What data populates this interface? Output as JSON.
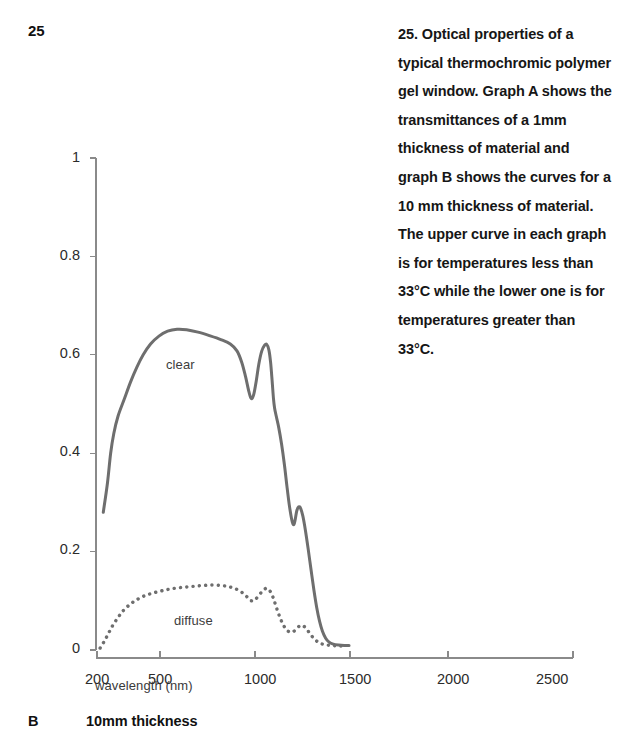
{
  "page_number": "25",
  "caption": "25. Optical properties of a typical thermochromic polymer gel window. Graph A shows the transmittances of a 1mm thickness of material and graph B shows the curves for a 10 mm thickness of material. The upper curve in each graph is for temperatures less than 33°C while the lower one is for temperatures greater than 33°C.",
  "footer": {
    "letter": "B",
    "text": "10mm thickness"
  },
  "colors": {
    "curve": "#6e6e6e",
    "axis": "#8a8a8a",
    "text": "#1a1a1a"
  },
  "chart_data": {
    "type": "line",
    "title": "",
    "xlabel": "wavelength (nm)",
    "ylabel": "hemispherical transmittance",
    "xtick_labels": [
      "200",
      "500",
      "1000",
      "1500",
      "2000",
      "2500"
    ],
    "xtick_values": [
      200,
      500,
      1000,
      1500,
      2000,
      2500
    ],
    "ytick_labels": [
      "0",
      "0.2",
      "0.4",
      "0.6",
      "0.8",
      "1"
    ],
    "ytick_values": [
      0,
      0.2,
      0.4,
      0.6,
      0.8,
      1
    ],
    "xlim": [
      200,
      2500
    ],
    "ylim": [
      0,
      1
    ],
    "grid": false,
    "legend": "inline-annotations",
    "series": [
      {
        "name": "clear",
        "style": "solid",
        "label_position": {
          "x": 620,
          "y": 0.565
        },
        "points": [
          [
            230,
            0.28
          ],
          [
            250,
            0.34
          ],
          [
            265,
            0.4
          ],
          [
            280,
            0.44
          ],
          [
            300,
            0.475
          ],
          [
            330,
            0.51
          ],
          [
            360,
            0.545
          ],
          [
            390,
            0.575
          ],
          [
            420,
            0.6
          ],
          [
            455,
            0.622
          ],
          [
            495,
            0.638
          ],
          [
            540,
            0.648
          ],
          [
            590,
            0.652
          ],
          [
            640,
            0.651
          ],
          [
            700,
            0.646
          ],
          [
            760,
            0.639
          ],
          [
            820,
            0.631
          ],
          [
            870,
            0.622
          ],
          [
            905,
            0.608
          ],
          [
            930,
            0.585
          ],
          [
            950,
            0.556
          ],
          [
            968,
            0.525
          ],
          [
            980,
            0.511
          ],
          [
            993,
            0.519
          ],
          [
            1007,
            0.548
          ],
          [
            1020,
            0.581
          ],
          [
            1035,
            0.607
          ],
          [
            1050,
            0.619
          ],
          [
            1062,
            0.621
          ],
          [
            1073,
            0.61
          ],
          [
            1082,
            0.585
          ],
          [
            1090,
            0.548
          ],
          [
            1097,
            0.512
          ],
          [
            1103,
            0.492
          ],
          [
            1112,
            0.475
          ],
          [
            1125,
            0.452
          ],
          [
            1140,
            0.418
          ],
          [
            1155,
            0.376
          ],
          [
            1168,
            0.333
          ],
          [
            1180,
            0.296
          ],
          [
            1190,
            0.272
          ],
          [
            1198,
            0.258
          ],
          [
            1205,
            0.255
          ],
          [
            1212,
            0.266
          ],
          [
            1220,
            0.283
          ],
          [
            1230,
            0.291
          ],
          [
            1240,
            0.288
          ],
          [
            1252,
            0.272
          ],
          [
            1265,
            0.244
          ],
          [
            1280,
            0.205
          ],
          [
            1295,
            0.163
          ],
          [
            1310,
            0.122
          ],
          [
            1325,
            0.086
          ],
          [
            1340,
            0.058
          ],
          [
            1355,
            0.038
          ],
          [
            1372,
            0.024
          ],
          [
            1390,
            0.016
          ],
          [
            1412,
            0.012
          ],
          [
            1440,
            0.01
          ],
          [
            1470,
            0.009
          ],
          [
            1495,
            0.009
          ]
        ]
      },
      {
        "name": "diffuse",
        "style": "dotted",
        "label_position": {
          "x": 600,
          "y": 0.092
        },
        "points": [
          [
            215,
            0.004
          ],
          [
            235,
            0.018
          ],
          [
            255,
            0.034
          ],
          [
            275,
            0.05
          ],
          [
            300,
            0.066
          ],
          [
            325,
            0.08
          ],
          [
            355,
            0.092
          ],
          [
            385,
            0.101
          ],
          [
            420,
            0.109
          ],
          [
            460,
            0.115
          ],
          [
            505,
            0.12
          ],
          [
            555,
            0.124
          ],
          [
            610,
            0.127
          ],
          [
            665,
            0.129
          ],
          [
            720,
            0.131
          ],
          [
            775,
            0.132
          ],
          [
            825,
            0.131
          ],
          [
            870,
            0.128
          ],
          [
            905,
            0.123
          ],
          [
            935,
            0.116
          ],
          [
            958,
            0.108
          ],
          [
            975,
            0.101
          ],
          [
            990,
            0.1
          ],
          [
            1005,
            0.104
          ],
          [
            1022,
            0.112
          ],
          [
            1040,
            0.12
          ],
          [
            1056,
            0.125
          ],
          [
            1070,
            0.124
          ],
          [
            1082,
            0.118
          ],
          [
            1095,
            0.107
          ],
          [
            1108,
            0.092
          ],
          [
            1122,
            0.076
          ],
          [
            1138,
            0.06
          ],
          [
            1155,
            0.047
          ],
          [
            1172,
            0.039
          ],
          [
            1190,
            0.036
          ],
          [
            1208,
            0.039
          ],
          [
            1225,
            0.046
          ],
          [
            1242,
            0.05
          ],
          [
            1258,
            0.048
          ],
          [
            1275,
            0.041
          ],
          [
            1293,
            0.031
          ],
          [
            1312,
            0.023
          ],
          [
            1332,
            0.016
          ],
          [
            1355,
            0.012
          ],
          [
            1382,
            0.01
          ],
          [
            1412,
            0.009
          ],
          [
            1445,
            0.008
          ],
          [
            1480,
            0.008
          ]
        ]
      }
    ]
  }
}
